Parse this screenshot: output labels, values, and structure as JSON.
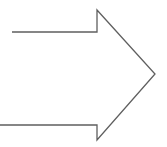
{
  "canvas": {
    "width": 167,
    "height": 147,
    "background_color": "#ffffff"
  },
  "diagram": {
    "title": "right-pointing arrow outline",
    "shape_name": "right-arrow",
    "stroke_color": "#5f5f5f",
    "stroke_width": 1.3,
    "fill_color": "none",
    "direction": "right",
    "closed": false,
    "points": "12,32 97,32 97,10 155,74 97,140 97,125 0,125",
    "vertices": [
      {
        "name": "shaft-top-left-end",
        "x": 12,
        "y": 32
      },
      {
        "name": "shaft-top-right-notch",
        "x": 97,
        "y": 32
      },
      {
        "name": "head-top-barb",
        "x": 97,
        "y": 10
      },
      {
        "name": "head-tip",
        "x": 155,
        "y": 74
      },
      {
        "name": "head-bottom-barb",
        "x": 97,
        "y": 140
      },
      {
        "name": "shaft-bottom-right-notch",
        "x": 97,
        "y": 125
      },
      {
        "name": "shaft-bottom-left-end",
        "x": 0,
        "y": 125
      }
    ]
  }
}
